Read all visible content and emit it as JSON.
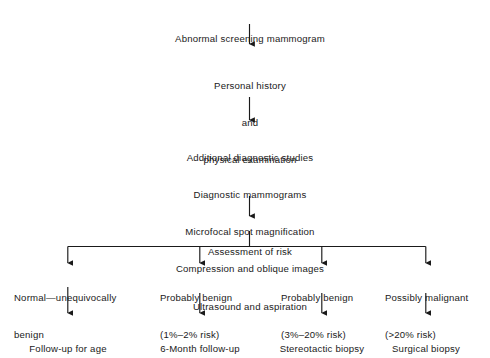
{
  "diagram": {
    "title_node": "Abnormal screening mammogram",
    "history_node": {
      "lines": [
        "Personal history",
        "and",
        "physical examination"
      ]
    },
    "studies_node": {
      "lines": [
        "Additional diagnostic studies",
        "Diagnostic mammograms",
        "Microfocal spot magnification",
        "Compression and oblique images",
        "Ultrasound and aspiration"
      ]
    },
    "assessment_node": "Assessment of risk",
    "branches": [
      {
        "label_lines": [
          "Normal—unequivocally",
          "benign"
        ],
        "outcome": "Follow-up for age"
      },
      {
        "label_lines": [
          "Probably benign",
          "(1%–2% risk)"
        ],
        "outcome": "6-Month follow-up"
      },
      {
        "label_lines": [
          "Probably benign",
          "(3%–20% risk)"
        ],
        "outcome": "Stereotactic biopsy"
      },
      {
        "label_lines": [
          "Possibly malignant",
          "(>20% risk)"
        ],
        "outcome": "Surgical biopsy"
      }
    ],
    "colors": {
      "line": "#1a1a1a",
      "text": "#1a1a1a",
      "background": "#ffffff"
    }
  }
}
